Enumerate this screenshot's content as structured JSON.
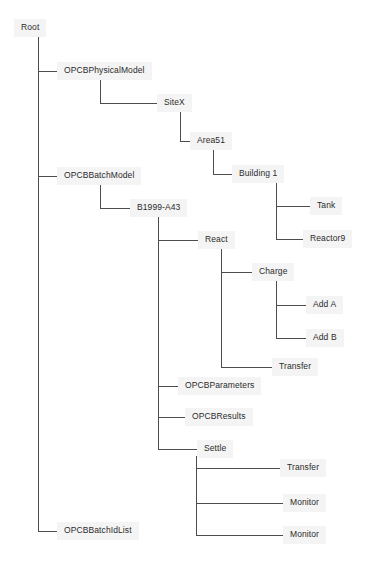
{
  "diagram": {
    "type": "tree",
    "title": "Root",
    "style": {
      "line_color": "#4d4d4d",
      "line_width": 1,
      "text_color": "#2b2b2b",
      "label_background": "#f4f4f4",
      "canvas_background": "#ffffff",
      "font_size_px": 8.5
    },
    "nodes": [
      {
        "id": "root",
        "label": "Root",
        "x": 14,
        "y": 28,
        "trunk_x": 38,
        "depth": 0,
        "parent": null
      },
      {
        "id": "physicalmodel",
        "label": "OPCBPhysicalModel",
        "x": 57,
        "y": 71,
        "trunk_x": 100,
        "depth": 1,
        "parent": "root"
      },
      {
        "id": "sitex",
        "label": "SiteX",
        "x": 157,
        "y": 103,
        "trunk_x": 180,
        "depth": 2,
        "parent": "physicalmodel"
      },
      {
        "id": "area51",
        "label": "Area51",
        "x": 190,
        "y": 141,
        "trunk_x": 213,
        "depth": 3,
        "parent": "sitex"
      },
      {
        "id": "building1",
        "label": "Building 1",
        "x": 232,
        "y": 174,
        "trunk_x": 276,
        "depth": 4,
        "parent": "area51"
      },
      {
        "id": "tank",
        "label": "Tank",
        "x": 310,
        "y": 206,
        "trunk_x": null,
        "depth": 5,
        "parent": "building1"
      },
      {
        "id": "reactor9",
        "label": "Reactor9",
        "x": 303,
        "y": 239,
        "trunk_x": null,
        "depth": 5,
        "parent": "building1"
      },
      {
        "id": "batchmodel",
        "label": "OPCBBatchModel",
        "x": 57,
        "y": 176,
        "trunk_x": 100,
        "depth": 1,
        "parent": "root"
      },
      {
        "id": "b1999a43",
        "label": "B1999-A43",
        "x": 130,
        "y": 208,
        "trunk_x": 158,
        "depth": 2,
        "parent": "batchmodel"
      },
      {
        "id": "react",
        "label": "React",
        "x": 198,
        "y": 240,
        "trunk_x": 221,
        "depth": 3,
        "parent": "b1999a43"
      },
      {
        "id": "charge",
        "label": "Charge",
        "x": 252,
        "y": 272,
        "trunk_x": 276,
        "depth": 4,
        "parent": "react"
      },
      {
        "id": "adda",
        "label": "Add A",
        "x": 306,
        "y": 305,
        "trunk_x": null,
        "depth": 5,
        "parent": "charge"
      },
      {
        "id": "addb",
        "label": "Add B",
        "x": 306,
        "y": 338,
        "trunk_x": null,
        "depth": 5,
        "parent": "charge"
      },
      {
        "id": "transfer1",
        "label": "Transfer",
        "x": 272,
        "y": 367,
        "trunk_x": null,
        "depth": 4,
        "parent": "react"
      },
      {
        "id": "opcbparameters",
        "label": "OPCBParameters",
        "x": 178,
        "y": 386,
        "trunk_x": null,
        "depth": 3,
        "parent": "b1999a43"
      },
      {
        "id": "opcbresults",
        "label": "OPCBResults",
        "x": 185,
        "y": 417,
        "trunk_x": null,
        "depth": 3,
        "parent": "b1999a43"
      },
      {
        "id": "settle",
        "label": "Settle",
        "x": 197,
        "y": 449,
        "trunk_x": 196,
        "depth": 3,
        "parent": "b1999a43"
      },
      {
        "id": "transfer2",
        "label": "Transfer",
        "x": 280,
        "y": 468,
        "trunk_x": null,
        "depth": 4,
        "parent": "settle"
      },
      {
        "id": "monitor1",
        "label": "Monitor",
        "x": 283,
        "y": 503,
        "trunk_x": null,
        "depth": 4,
        "parent": "settle"
      },
      {
        "id": "monitor2",
        "label": "Monitor",
        "x": 283,
        "y": 535,
        "trunk_x": null,
        "depth": 4,
        "parent": "settle"
      },
      {
        "id": "batchidlist",
        "label": "OPCBBatchIdList",
        "x": 57,
        "y": 531,
        "trunk_x": null,
        "depth": 1,
        "parent": "root"
      }
    ],
    "edges": [
      {
        "from": "root",
        "to": "physicalmodel",
        "style": "tee"
      },
      {
        "from": "root",
        "to": "batchmodel",
        "style": "tee"
      },
      {
        "from": "root",
        "to": "batchidlist",
        "style": "elbow"
      },
      {
        "from": "physicalmodel",
        "to": "sitex",
        "style": "elbow"
      },
      {
        "from": "sitex",
        "to": "area51",
        "style": "elbow"
      },
      {
        "from": "area51",
        "to": "building1",
        "style": "elbow"
      },
      {
        "from": "building1",
        "to": "tank",
        "style": "tee"
      },
      {
        "from": "building1",
        "to": "reactor9",
        "style": "elbow"
      },
      {
        "from": "batchmodel",
        "to": "b1999a43",
        "style": "elbow"
      },
      {
        "from": "b1999a43",
        "to": "react",
        "style": "tee"
      },
      {
        "from": "b1999a43",
        "to": "opcbparameters",
        "style": "tee"
      },
      {
        "from": "b1999a43",
        "to": "opcbresults",
        "style": "tee"
      },
      {
        "from": "b1999a43",
        "to": "settle",
        "style": "elbow"
      },
      {
        "from": "react",
        "to": "charge",
        "style": "tee"
      },
      {
        "from": "react",
        "to": "transfer1",
        "style": "elbow"
      },
      {
        "from": "charge",
        "to": "adda",
        "style": "tee"
      },
      {
        "from": "charge",
        "to": "addb",
        "style": "elbow"
      },
      {
        "from": "settle",
        "to": "transfer2",
        "style": "tee"
      },
      {
        "from": "settle",
        "to": "monitor1",
        "style": "tee"
      },
      {
        "from": "settle",
        "to": "monitor2",
        "style": "elbow"
      }
    ]
  }
}
